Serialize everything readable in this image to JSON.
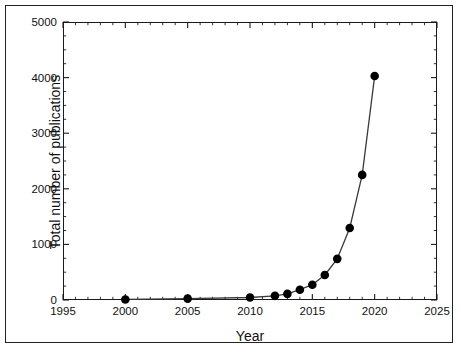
{
  "chart_data": {
    "type": "line",
    "title": "",
    "xlabel": "Year",
    "ylabel": "Total number of publications",
    "xlim": [
      1995,
      2025
    ],
    "ylim": [
      0,
      5000
    ],
    "xticks": [
      1995,
      2000,
      2005,
      2010,
      2015,
      2020,
      2025
    ],
    "yticks": [
      0,
      1000,
      2000,
      3000,
      4000,
      5000
    ],
    "xtick_labels": [
      "1995",
      "2000",
      "2005",
      "2010",
      "2015",
      "2020",
      "2025"
    ],
    "ytick_labels": [
      "0",
      "1000",
      "2000",
      "3000",
      "4000",
      "5000"
    ],
    "minor_ticks": true,
    "grid": false,
    "legend": null,
    "marker": "filled-circle",
    "line_color": "#333333",
    "marker_color": "#000000",
    "x": [
      2000,
      2005,
      2010,
      2012,
      2013,
      2014,
      2015,
      2016,
      2017,
      2018,
      2019,
      2020
    ],
    "values": [
      10,
      25,
      45,
      75,
      110,
      185,
      275,
      450,
      740,
      1295,
      2250,
      4030
    ],
    "series": [
      {
        "name": "Total number of publications",
        "x": [
          2000,
          2005,
          2010,
          2012,
          2013,
          2014,
          2015,
          2016,
          2017,
          2018,
          2019,
          2020
        ],
        "values": [
          10,
          25,
          45,
          75,
          110,
          185,
          275,
          450,
          740,
          1295,
          2250,
          4030
        ]
      }
    ]
  },
  "axes": {
    "x_axis_label": "Year",
    "y_axis_label": "Total number of publications"
  }
}
